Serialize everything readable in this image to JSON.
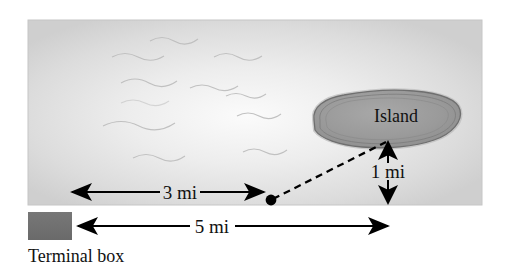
{
  "figure": {
    "title_alt": "Offshore island distance diagram",
    "water": {
      "label": "water-surface",
      "fill_light": "#f4f4f4",
      "fill_mid": "#d4d4d4",
      "fill_edge": "#c9c9c9"
    },
    "island": {
      "label": "Island",
      "fill": "#9a9a9a",
      "outline": "#6f6f6f",
      "halo": "#bdbdbd"
    },
    "point": {
      "name": "connection-point",
      "color": "#000000"
    },
    "cable": {
      "name": "dashed-cable-line",
      "style": "dashed",
      "color": "#000000"
    },
    "dimensions": [
      {
        "id": "shore-run",
        "label": "3 mi",
        "orientation": "horizontal",
        "arrow": "double"
      },
      {
        "id": "island-offset",
        "label": "1 mi",
        "orientation": "vertical",
        "arrow": "double"
      },
      {
        "id": "total-span",
        "label": "5 mi",
        "orientation": "horizontal",
        "arrow": "double"
      }
    ],
    "legend": {
      "swatch_name": "terminal-box-swatch",
      "swatch_color": "#6f6f6f",
      "caption": "Terminal box"
    }
  }
}
